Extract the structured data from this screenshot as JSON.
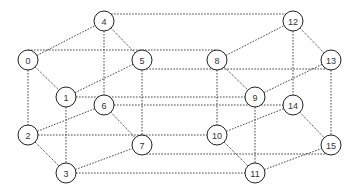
{
  "diagram": {
    "title": "",
    "type": "4-dimensional hypercube graph",
    "node_radius": 10,
    "nodes": [
      {
        "id": "0",
        "label": "0",
        "x": 28,
        "y": 60
      },
      {
        "id": "1",
        "label": "1",
        "x": 66,
        "y": 97
      },
      {
        "id": "2",
        "label": "2",
        "x": 28,
        "y": 135
      },
      {
        "id": "3",
        "label": "3",
        "x": 66,
        "y": 173
      },
      {
        "id": "4",
        "label": "4",
        "x": 104,
        "y": 21
      },
      {
        "id": "5",
        "label": "5",
        "x": 142,
        "y": 60
      },
      {
        "id": "6",
        "label": "6",
        "x": 104,
        "y": 105
      },
      {
        "id": "7",
        "label": "7",
        "x": 142,
        "y": 145
      },
      {
        "id": "8",
        "label": "8",
        "x": 217,
        "y": 60
      },
      {
        "id": "9",
        "label": "9",
        "x": 255,
        "y": 97
      },
      {
        "id": "10",
        "label": "10",
        "x": 217,
        "y": 135
      },
      {
        "id": "11",
        "label": "11",
        "x": 255,
        "y": 173
      },
      {
        "id": "12",
        "label": "12",
        "x": 293,
        "y": 21
      },
      {
        "id": "13",
        "label": "13",
        "x": 331,
        "y": 60
      },
      {
        "id": "14",
        "label": "14",
        "x": 293,
        "y": 105
      },
      {
        "id": "15",
        "label": "15",
        "x": 331,
        "y": 145
      }
    ],
    "edges": [
      {
        "from": "0",
        "to": "1",
        "dim": 0
      },
      {
        "from": "2",
        "to": "3",
        "dim": 0
      },
      {
        "from": "4",
        "to": "5",
        "dim": 0
      },
      {
        "from": "6",
        "to": "7",
        "dim": 0
      },
      {
        "from": "8",
        "to": "9",
        "dim": 0
      },
      {
        "from": "10",
        "to": "11",
        "dim": 0
      },
      {
        "from": "12",
        "to": "13",
        "dim": 0
      },
      {
        "from": "14",
        "to": "15",
        "dim": 0
      },
      {
        "from": "0",
        "to": "2",
        "dim": 1
      },
      {
        "from": "1",
        "to": "3",
        "dim": 1
      },
      {
        "from": "4",
        "to": "6",
        "dim": 1
      },
      {
        "from": "5",
        "to": "7",
        "dim": 1
      },
      {
        "from": "8",
        "to": "10",
        "dim": 1
      },
      {
        "from": "9",
        "to": "11",
        "dim": 1
      },
      {
        "from": "12",
        "to": "14",
        "dim": 1
      },
      {
        "from": "13",
        "to": "15",
        "dim": 1
      },
      {
        "from": "0",
        "to": "4",
        "dim": 2
      },
      {
        "from": "1",
        "to": "5",
        "dim": 2
      },
      {
        "from": "2",
        "to": "6",
        "dim": 2
      },
      {
        "from": "3",
        "to": "7",
        "dim": 2
      },
      {
        "from": "8",
        "to": "12",
        "dim": 2
      },
      {
        "from": "9",
        "to": "13",
        "dim": 2
      },
      {
        "from": "10",
        "to": "14",
        "dim": 2
      },
      {
        "from": "11",
        "to": "15",
        "dim": 2
      },
      {
        "from": "0",
        "to": "8",
        "dim": 3,
        "y_offset": -10
      },
      {
        "from": "1",
        "to": "9",
        "dim": 3,
        "y_offset": 0
      },
      {
        "from": "2",
        "to": "10",
        "dim": 3,
        "y_offset": 0
      },
      {
        "from": "3",
        "to": "11",
        "dim": 3,
        "y_offset": 0
      },
      {
        "from": "4",
        "to": "12",
        "dim": 3,
        "y_offset": -7
      },
      {
        "from": "5",
        "to": "13",
        "dim": 3,
        "y_offset": 9
      },
      {
        "from": "6",
        "to": "14",
        "dim": 3,
        "y_offset": 0
      },
      {
        "from": "7",
        "to": "15",
        "dim": 3,
        "y_offset": 9
      }
    ]
  }
}
